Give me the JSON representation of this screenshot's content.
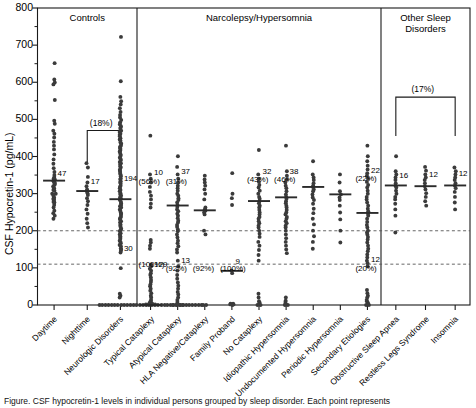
{
  "figure": {
    "y_axis_title": "CSF Hypocretin-1 (pg/mL)",
    "y_ticks": [
      "800",
      "700",
      "600",
      "500",
      "400",
      "300",
      "200",
      "100",
      "0"
    ],
    "panels": [
      {
        "name": "controls",
        "label": "Controls"
      },
      {
        "name": "narcolepsy",
        "label": "Narcolepsy/Hypersomnia"
      },
      {
        "name": "other",
        "label": "Other Sleep\nDisorders"
      }
    ],
    "bracket_labels": [
      {
        "name": "controls-bracket",
        "label": "(18%)"
      },
      {
        "name": "other-bracket",
        "label": "(17%)"
      }
    ],
    "caption": "Figure. CSF hypocretin-1 levels in individual persons grouped by sleep disorder. Each point represents"
  },
  "chart_data": {
    "type": "scatter",
    "xlabel": "",
    "ylabel": "CSF Hypocretin-1 (pg/mL)",
    "ylim": [
      0,
      800
    ],
    "ytick_values": [
      0,
      100,
      200,
      300,
      400,
      500,
      600,
      700,
      800
    ],
    "minor_tick_step": 50,
    "grid": false,
    "reference_lines": [
      {
        "name": "upper-threshold",
        "y": 200,
        "style": "dashed"
      },
      {
        "name": "lower-threshold",
        "y": 110,
        "style": "dashed"
      }
    ],
    "panel_brackets": [
      {
        "panel": "Controls",
        "label": "(18%)",
        "spans": [
          "Nighttime",
          "Neurologic Disorders"
        ],
        "y_top": 470,
        "y_bottom": 385
      },
      {
        "panel": "Other Sleep Disorders",
        "label": "(17%)",
        "spans": [
          "Obstructive Sleep Apnea",
          "Insomnia"
        ],
        "y_top": 560,
        "y_bottom": 455
      }
    ],
    "categories": [
      "Daytime",
      "Nighttime",
      "Neurologic Disorders",
      "Typical Cataplexy",
      "Atypical Cataplexy",
      "HLA Negative/Cataplexy",
      "Family Proband",
      "No Cataplexy",
      "Idiopathic Hypersomnia",
      "Undocumented Hypersomnia",
      "Periodic Hypersomnia",
      "Secondary Etiologies",
      "Obstructive Sleep Apnea",
      "Restless Legs Syndrome",
      "Insomnia"
    ],
    "panel_assignment": [
      "Controls",
      "Controls",
      "Controls",
      "Narcolepsy/Hypersomnia",
      "Narcolepsy/Hypersomnia",
      "Narcolepsy/Hypersomnia",
      "Narcolepsy/Hypersomnia",
      "Narcolepsy/Hypersomnia",
      "Narcolepsy/Hypersomnia",
      "Narcolepsy/Hypersomnia",
      "Narcolepsy/Hypersomnia",
      "Narcolepsy/Hypersomnia",
      "Other Sleep Disorders",
      "Other Sleep Disorders",
      "Other Sleep Disorders"
    ],
    "groups": [
      {
        "category": "Daytime",
        "median": 335,
        "annotations": [
          {
            "text": "47",
            "y": 352
          }
        ],
        "values": [
          651,
          608,
          600,
          594,
          553,
          497,
          489,
          470,
          462,
          452,
          440,
          430,
          420,
          405,
          392,
          380,
          368,
          358,
          350,
          345,
          340,
          338,
          335,
          333,
          330,
          325,
          320,
          315,
          308,
          300,
          295,
          288,
          282,
          276,
          270,
          262,
          255,
          248,
          240,
          232,
          300,
          310,
          318,
          328,
          290,
          285,
          278
        ]
      },
      {
        "category": "Nighttime",
        "median": 307,
        "annotations": [
          {
            "text": "17",
            "y": 330
          }
        ],
        "values": [
          382,
          370,
          345,
          330,
          320,
          312,
          307,
          302,
          296,
          288,
          280,
          270,
          258,
          245,
          232,
          220,
          208
        ]
      },
      {
        "category": "Neurologic Disorders",
        "median": 285,
        "annotations": [
          {
            "text": "194",
            "y": 340
          },
          {
            "text": "30",
            "y": 152
          }
        ],
        "values": [
          722,
          603,
          560,
          548,
          540,
          530,
          520,
          512,
          505,
          498,
          492,
          487,
          482,
          478,
          474,
          470,
          466,
          462,
          458,
          454,
          450,
          446,
          442,
          438,
          434,
          430,
          426,
          422,
          418,
          414,
          410,
          406,
          402,
          398,
          394,
          390,
          386,
          382,
          378,
          374,
          370,
          366,
          362,
          358,
          354,
          350,
          346,
          342,
          338,
          334,
          330,
          326,
          322,
          318,
          314,
          310,
          306,
          302,
          298,
          294,
          290,
          286,
          282,
          278,
          274,
          270,
          266,
          262,
          258,
          254,
          250,
          246,
          242,
          238,
          234,
          230,
          226,
          222,
          218,
          214,
          210,
          206,
          202,
          198,
          194,
          190,
          186,
          182,
          178,
          174,
          170,
          166,
          162,
          158,
          154,
          150,
          146,
          142,
          100,
          30,
          25,
          20
        ]
      },
      {
        "category": "Typical Cataplexy",
        "median": 0,
        "annotations": [
          {
            "text": "10",
            "y": 355
          },
          {
            "text": "(56%)",
            "y": 330
          },
          {
            "text": "129",
            "y": 108
          },
          {
            "text": "(100%)",
            "y": 108
          }
        ],
        "values": [
          456,
          352,
          340,
          330,
          318,
          305,
          295,
          285,
          272,
          262,
          175,
          168,
          160,
          152,
          110,
          104,
          98,
          92,
          86,
          80,
          74,
          68,
          62,
          56,
          50,
          44,
          38,
          32,
          26,
          20,
          14,
          10,
          8,
          6,
          4,
          3,
          2,
          2,
          1,
          1,
          0,
          0,
          0,
          0,
          0,
          0,
          0,
          0,
          0,
          0,
          0,
          0,
          0,
          0,
          0,
          0,
          0,
          0,
          0,
          0,
          0,
          0,
          0,
          0,
          0,
          0,
          0,
          0,
          0,
          0,
          0,
          0,
          0,
          0
        ]
      },
      {
        "category": "Atypical Cataplexy",
        "median": 268,
        "annotations": [
          {
            "text": "37",
            "y": 358
          },
          {
            "text": "(31%)",
            "y": 332
          },
          {
            "text": "13",
            "y": 118
          },
          {
            "text": "(92%)",
            "y": 96
          }
        ],
        "values": [
          400,
          372,
          352,
          340,
          330,
          322,
          315,
          308,
          300,
          294,
          288,
          282,
          276,
          270,
          264,
          258,
          252,
          246,
          240,
          234,
          228,
          222,
          216,
          210,
          204,
          198,
          190,
          182,
          174,
          166,
          158,
          150,
          142,
          120,
          105,
          92,
          80,
          70,
          60,
          52,
          44,
          36,
          28,
          20,
          14,
          8,
          4,
          2,
          0,
          0,
          0,
          0
        ]
      },
      {
        "category": "HLA Negative/Cataplexy",
        "median": 255,
        "annotations": [
          {
            "text": "(92%)",
            "y": 96
          }
        ],
        "values": [
          348,
          338,
          330,
          322,
          312,
          300,
          285,
          262,
          258,
          255,
          250,
          244,
          200,
          190,
          0,
          0
        ]
      },
      {
        "category": "Family Proband",
        "median": 92,
        "annotations": [
          {
            "text": "9",
            "y": 115
          },
          {
            "text": "(100%)",
            "y": 96
          }
        ],
        "values": [
          356,
          300,
          288,
          270,
          92,
          86,
          4,
          3,
          2,
          1,
          0
        ]
      },
      {
        "category": "No Cataplexy",
        "median": 280,
        "annotations": [
          {
            "text": "32",
            "y": 358
          },
          {
            "text": "(43%)",
            "y": 336
          }
        ],
        "values": [
          418,
          352,
          340,
          332,
          324,
          316,
          308,
          300,
          292,
          286,
          280,
          274,
          268,
          262,
          256,
          250,
          244,
          238,
          232,
          226,
          220,
          214,
          208,
          200,
          192,
          184,
          170,
          160,
          148,
          134,
          120,
          30,
          20,
          10,
          6,
          2,
          0,
          0
        ]
      },
      {
        "category": "Idiopathic Hypersomnia",
        "median": 290,
        "annotations": [
          {
            "text": "38",
            "y": 358
          },
          {
            "text": "(46%)",
            "y": 336
          }
        ],
        "values": [
          430,
          360,
          348,
          338,
          330,
          322,
          314,
          306,
          298,
          292,
          286,
          280,
          274,
          268,
          262,
          256,
          250,
          244,
          238,
          232,
          226,
          220,
          214,
          208,
          200,
          190,
          180,
          170,
          160,
          150,
          140,
          20,
          12,
          8,
          4,
          2,
          0,
          0
        ]
      },
      {
        "category": "Undocumented Hypersomnia",
        "median": 318,
        "annotations": [],
        "values": [
          388,
          352,
          344,
          336,
          328,
          322,
          318,
          312,
          306,
          298,
          290,
          282,
          272,
          260,
          248,
          232,
          218,
          200,
          186,
          170,
          152
        ]
      },
      {
        "category": "Periodic Hypersomnia",
        "median": 298,
        "annotations": [],
        "values": [
          352,
          330,
          306,
          298,
          290,
          282,
          268,
          250,
          230,
          200,
          168
        ]
      },
      {
        "category": "Secondary Etiologies",
        "median": 248,
        "annotations": [
          {
            "text": "22",
            "y": 362
          },
          {
            "text": "(22%)",
            "y": 340
          },
          {
            "text": "12",
            "y": 120
          },
          {
            "text": "(20%)",
            "y": 98
          }
        ],
        "values": [
          430,
          400,
          388,
          376,
          366,
          356,
          348,
          340,
          332,
          324,
          316,
          308,
          300,
          292,
          284,
          276,
          268,
          260,
          252,
          246,
          240,
          232,
          224,
          216,
          208,
          200,
          196,
          190,
          184,
          176,
          168,
          160,
          152,
          144,
          136,
          128,
          120,
          112,
          104,
          40,
          32,
          26,
          20,
          14,
          10,
          6,
          4,
          2,
          0,
          0
        ]
      },
      {
        "category": "Obstructive Sleep Apnea",
        "median": 322,
        "annotations": [
          {
            "text": "16",
            "y": 348
          }
        ],
        "values": [
          400,
          360,
          352,
          344,
          336,
          328,
          322,
          316,
          308,
          300,
          292,
          284,
          272,
          258,
          240,
          196
        ]
      },
      {
        "category": "Restless Legs Syndrome",
        "median": 320,
        "annotations": [
          {
            "text": "12",
            "y": 350
          }
        ],
        "values": [
          372,
          362,
          352,
          344,
          336,
          328,
          320,
          312,
          302,
          292,
          280,
          268
        ]
      },
      {
        "category": "Insomnia",
        "median": 322,
        "annotations": [
          {
            "text": "12",
            "y": 352
          }
        ],
        "values": [
          370,
          360,
          352,
          344,
          336,
          328,
          322,
          314,
          304,
          292,
          276,
          258
        ]
      }
    ]
  }
}
